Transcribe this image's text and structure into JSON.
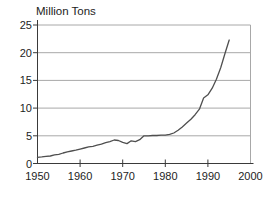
{
  "title": "Million Tons",
  "chart_data": {
    "type": "line",
    "title": "Million Tons",
    "xlabel": "",
    "ylabel": "Million Tons",
    "x": [
      1950,
      1951,
      1952,
      1953,
      1954,
      1955,
      1956,
      1957,
      1958,
      1959,
      1960,
      1961,
      1962,
      1963,
      1964,
      1965,
      1966,
      1967,
      1968,
      1969,
      1970,
      1971,
      1972,
      1973,
      1974,
      1975,
      1976,
      1977,
      1978,
      1979,
      1980,
      1981,
      1982,
      1983,
      1984,
      1985,
      1986,
      1987,
      1988,
      1989,
      1990,
      1991,
      1992,
      1993,
      1994,
      1995
    ],
    "values": [
      1.1,
      1.2,
      1.3,
      1.35,
      1.55,
      1.65,
      1.9,
      2.1,
      2.25,
      2.4,
      2.6,
      2.8,
      3.0,
      3.1,
      3.3,
      3.5,
      3.75,
      3.95,
      4.25,
      4.15,
      3.8,
      3.6,
      4.1,
      3.95,
      4.3,
      5.0,
      5.0,
      5.05,
      5.05,
      5.1,
      5.1,
      5.25,
      5.5,
      6.0,
      6.6,
      7.3,
      8.0,
      8.8,
      9.8,
      11.8,
      12.4,
      13.6,
      15.2,
      17.3,
      19.8,
      22.3
    ],
    "xlim": [
      1950,
      2000
    ],
    "ylim": [
      0,
      25
    ],
    "xticks": [
      1950,
      1960,
      1970,
      1980,
      1990,
      2000
    ],
    "yticks": [
      0,
      5,
      10,
      15,
      20,
      25
    ],
    "grid": "horizontal",
    "legend": "none",
    "colors": {
      "line": "#4f4f4f",
      "grid": "#a8a8a8",
      "axis": "#3a3a3a",
      "text": "#1d1d1d",
      "background": "#ffffff"
    }
  }
}
